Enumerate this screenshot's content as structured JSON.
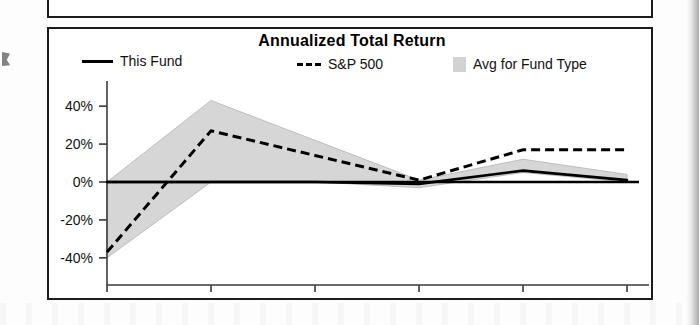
{
  "chart_data": {
    "type": "line",
    "title": "Annualized Total Return",
    "xlabel": "",
    "ylabel": "",
    "x": [
      "2007",
      "2008",
      "2009",
      "2010",
      "2011",
      "2012"
    ],
    "categories": [
      "2007",
      "2008",
      "2009",
      "2010",
      "2011",
      "2012"
    ],
    "xtick_labels": [
      "2007",
      "2008",
      "2009",
      "2010",
      "2011",
      "2012"
    ],
    "xtick_suffix": "YTD",
    "ytick_labels": [
      "40%",
      "20%",
      "0%",
      "-20%",
      "-40%"
    ],
    "ytick_values": [
      40,
      20,
      0,
      -20,
      -40
    ],
    "ylim": [
      -48,
      48
    ],
    "grid": false,
    "legend_position": "top",
    "series": [
      {
        "name": "This Fund",
        "style": "solid",
        "color": "#000000",
        "values": [
          0,
          0,
          0,
          -1,
          6,
          1
        ]
      },
      {
        "name": "S&P 500",
        "style": "dashed",
        "color": "#000000",
        "values": [
          -37,
          27,
          14,
          1,
          17,
          17
        ]
      },
      {
        "name": "Avg for Fund Type",
        "style": "shaded-band",
        "color": "#d6d6d6",
        "upper": [
          0,
          43,
          22,
          1,
          12,
          4
        ],
        "lower": [
          -40,
          0,
          0,
          -3,
          5,
          0
        ]
      }
    ]
  },
  "chart": {
    "title": "Annualized Total Return",
    "legend": [
      {
        "label": "This Fund",
        "swatch": "solid-line-swatch"
      },
      {
        "label": "S&P 500",
        "swatch": "dashed-line-swatch",
        "prefix": "---"
      },
      {
        "label": "Avg for Fund Type",
        "swatch": "shaded-box-swatch"
      }
    ],
    "axis": {
      "y_labels": [
        "40%",
        "20%",
        "0%",
        "-20%",
        "-40%"
      ],
      "x_labels": [
        "2007",
        "2008",
        "2009",
        "2010",
        "2011",
        "2012"
      ],
      "x_suffix": "YTD"
    }
  },
  "colors": {
    "band_fill": "#d6d6d6",
    "line": "#000000",
    "border": "#1c1c1c",
    "background": "#ffffff"
  }
}
